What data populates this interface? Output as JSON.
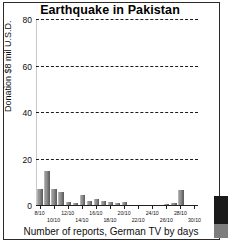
{
  "chart_data": {
    "type": "bar",
    "title": "Earthquake in Pakistan",
    "xlabel": "Number of reports, German TV by days",
    "ylabel": "Donation $8 mil U.S.D.",
    "ylim": [
      0,
      80
    ],
    "yticks": [
      0,
      20,
      40,
      60,
      80
    ],
    "ytick_labels": [
      "0",
      "20",
      "40",
      "60",
      "80"
    ],
    "grid": "horizontal-dashed",
    "legend": "none",
    "categories": [
      "8/10",
      "9/10",
      "10/10",
      "11/10",
      "12/10",
      "13/10",
      "14/10",
      "15/10",
      "16/10",
      "17/10",
      "18/10",
      "19/10",
      "20/10",
      "21/10",
      "22/10",
      "23/10",
      "24/10",
      "25/10",
      "26/10",
      "27/10",
      "28/10",
      "29/10",
      "30/10"
    ],
    "values": [
      7.2,
      15.2,
      7.5,
      6.2,
      1.6,
      1.5,
      4.8,
      2.0,
      3.2,
      2.2,
      1.9,
      1.2,
      1.7,
      0.6,
      0.5,
      0.4,
      0.3,
      0.3,
      1.0,
      1.2,
      7.0,
      0.4,
      0.2
    ],
    "xtick_labels_shown": [
      {
        "label": "8/10",
        "index": 0,
        "row": 0
      },
      {
        "label": "10/10",
        "index": 2,
        "row": 1
      },
      {
        "label": "12/10",
        "index": 4,
        "row": 0
      },
      {
        "label": "14/10",
        "index": 6,
        "row": 1
      },
      {
        "label": "16/10",
        "index": 8,
        "row": 0
      },
      {
        "label": "18/10",
        "index": 10,
        "row": 1
      },
      {
        "label": "20/10",
        "index": 12,
        "row": 0
      },
      {
        "label": "22/10",
        "index": 14,
        "row": 1
      },
      {
        "label": "24/10",
        "index": 16,
        "row": 0
      },
      {
        "label": "26/10",
        "index": 18,
        "row": 1
      },
      {
        "label": "28/10",
        "index": 20,
        "row": 0
      },
      {
        "label": "30/10",
        "index": 22,
        "row": 1
      }
    ],
    "bar_color": "#7a7a7a",
    "axis_color": "#1f1f1f",
    "grid_color": "#1c1c1c",
    "background": "#ffffff"
  }
}
